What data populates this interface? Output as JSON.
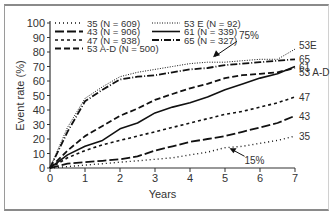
{
  "chart_data": {
    "type": "line",
    "title": "",
    "xlabel": "Years",
    "ylabel": "Event rate (%)",
    "xlim": [
      0,
      7
    ],
    "ylim": [
      0,
      100
    ],
    "x_ticks": [
      "0",
      "1",
      "2",
      "3",
      "4",
      "5",
      "6",
      "7"
    ],
    "y_ticks": [
      "0",
      "10",
      "20",
      "30",
      "40",
      "50",
      "60",
      "70",
      "80",
      "90",
      "100"
    ],
    "grid": false,
    "legend_position": "top-left, two columns",
    "x": [
      0,
      0.5,
      1,
      1.5,
      2,
      2.5,
      3,
      3.5,
      4,
      4.5,
      5,
      5.5,
      6,
      6.5,
      7
    ],
    "series": [
      {
        "name": "35 (N = 609)",
        "end_label": "35",
        "style": "dotted",
        "values": [
          0,
          1,
          2,
          3,
          4,
          5,
          6,
          7,
          9,
          11,
          14,
          15,
          17,
          19,
          22
        ]
      },
      {
        "name": "43 (N = 906)",
        "end_label": "43",
        "style": "long-dash",
        "values": [
          0,
          3,
          4,
          5,
          6,
          8,
          12,
          15,
          18,
          20,
          22,
          25,
          28,
          31,
          36
        ]
      },
      {
        "name": "47 (N = 938)",
        "end_label": "47",
        "style": "short-dash",
        "values": [
          0,
          7,
          12,
          16,
          19,
          22,
          25,
          28,
          31,
          34,
          37,
          39,
          42,
          45,
          49
        ]
      },
      {
        "name": "53 A-D (N = 500)",
        "end_label": "53 A-D",
        "style": "dashed",
        "values": [
          0,
          12,
          22,
          29,
          36,
          41,
          47,
          51,
          55,
          58,
          62,
          64,
          65,
          66,
          69
        ]
      },
      {
        "name": "53 E (N = 92)",
        "end_label": "53E",
        "style": "fine-dotted",
        "values": [
          0,
          28,
          48,
          56,
          63,
          66,
          68,
          70,
          72,
          73,
          73,
          74,
          75,
          75,
          82
        ]
      },
      {
        "name": "61 (N = 339)",
        "end_label": "61",
        "style": "solid",
        "values": [
          0,
          9,
          15,
          19,
          27,
          31,
          38,
          42,
          45,
          49,
          54,
          58,
          62,
          65,
          70
        ]
      },
      {
        "name": "65 (N = 327)",
        "end_label": "65",
        "style": "dash-dot",
        "values": [
          0,
          25,
          46,
          54,
          61,
          63,
          64,
          66,
          68,
          69,
          71,
          72,
          73,
          74,
          75
        ]
      }
    ],
    "annotations": [
      {
        "text": "75%",
        "x": 4.6,
        "y": 75
      },
      {
        "text": "15%",
        "x": 5.1,
        "y": 15
      }
    ]
  },
  "legend": {
    "col1": [
      "35 (N = 609)",
      "43 (N = 906)",
      "47 (N = 938)",
      "53 A-D (N = 500)"
    ],
    "col2": [
      "53 E (N = 92)",
      "61 (N = 339)",
      "65 (N = 327)"
    ]
  }
}
